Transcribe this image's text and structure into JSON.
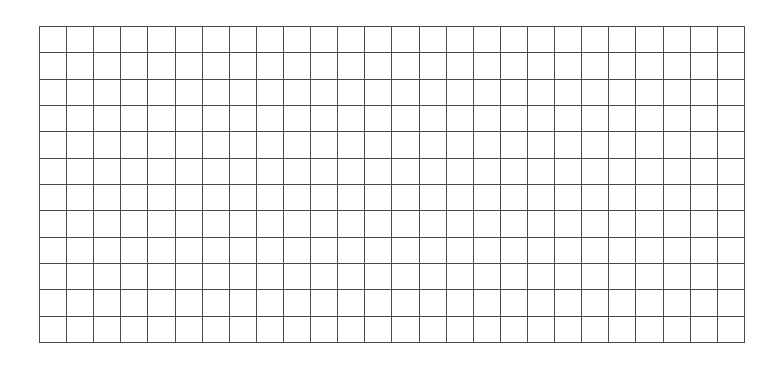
{
  "grid": {
    "columns": 26,
    "rows": 12,
    "cells_filled": 0,
    "line_color": "#4a4a4a",
    "background_color": "#ffffff"
  }
}
